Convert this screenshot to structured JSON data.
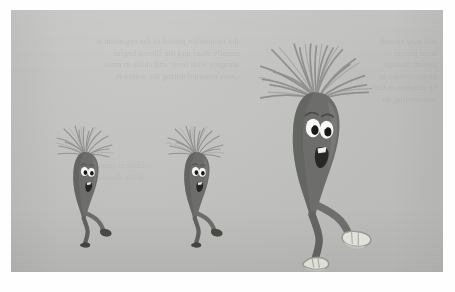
{
  "page": {
    "background_color": "#fefefe",
    "width": 455,
    "height": 292
  },
  "panel": {
    "name": "illustration-panel",
    "background_color": "#c3c4c2",
    "left": 11,
    "top": 10,
    "width": 432,
    "height": 262
  },
  "bleed_text": {
    "note": "Faint illegible show-through text from the reverse side of the printed page",
    "left_block": "the incubation period of the organism is\nusually short and the illness begins\nabruptly with fever and chills in most\ncases reported during the outbreak",
    "right_block": "and may spread\nfrom person to\nperson through\ndirect contact or\nby droplets in the\nsurrounding air",
    "lower_block": "clinical features\nof the disease"
  },
  "illustration": {
    "title": "Three cartoon germ characters walking",
    "body_color": "#6d6e6b",
    "body_shadow_color": "#565754",
    "body_highlight_color": "#7e7f7c",
    "hair_color": "#8a8b88",
    "eye_white_color": "#f7f7f5",
    "pupil_color": "#1b1b1a",
    "mouth_color": "#2b2b29",
    "tooth_color": "#f2f2ee",
    "dark_shoe_color": "#4a4b48",
    "light_shoe_color": "#e6e6df",
    "light_shoe_outline_color": "#9b9c97",
    "characters": [
      {
        "name": "germ-small-left",
        "label": "Small germ character (left)",
        "size": "small",
        "scale": 1.0,
        "shoe_style": "dark",
        "expression": "smiling",
        "hair_style": "spiky-fan",
        "pose": "walking"
      },
      {
        "name": "germ-small-middle",
        "label": "Small germ character (middle)",
        "size": "small",
        "scale": 1.0,
        "shoe_style": "dark",
        "expression": "smiling",
        "hair_style": "spiky-fan",
        "pose": "walking"
      },
      {
        "name": "germ-large-right",
        "label": "Large germ character (right)",
        "size": "large",
        "scale": 1.85,
        "shoe_style": "light",
        "expression": "smiling",
        "hair_style": "spiky-fan",
        "pose": "walking"
      }
    ]
  }
}
